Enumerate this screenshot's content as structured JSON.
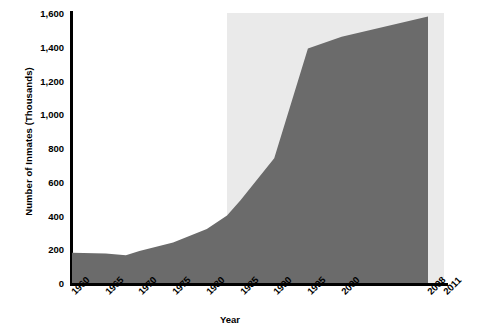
{
  "chart_data": {
    "type": "area",
    "title": "",
    "xlabel": "Year",
    "ylabel": "Number of Inmates (Thousands)",
    "xlim": [
      1960,
      2011
    ],
    "ylim": [
      0,
      1600
    ],
    "grid": false,
    "legend": "none",
    "x_tick_labels": [
      "1960",
      "1965",
      "1970",
      "1975",
      "1980",
      "1985",
      "1990",
      "1995",
      "2000",
      "2008",
      "2011"
    ],
    "x_tick_values": [
      1960,
      1965,
      1970,
      1975,
      1980,
      1985,
      1990,
      1995,
      2000,
      2008,
      2011
    ],
    "y_tick_labels": [
      "0",
      "200",
      "400",
      "600",
      "800",
      "1,000",
      "1,200",
      "1,400",
      "1,600"
    ],
    "y_tick_values": [
      0,
      200,
      400,
      600,
      800,
      1000,
      1200,
      1400,
      1600
    ],
    "series": [
      {
        "name": "Number of Inmates (Thousands)",
        "color": "#6b6b6b",
        "x": [
          1960,
          1965,
          1968,
          1970,
          1975,
          1980,
          1983,
          1985,
          1990,
          1995,
          2000,
          2008
        ],
        "values": [
          180,
          175,
          165,
          190,
          240,
          320,
          400,
          490,
          740,
          1390,
          1460,
          1580
        ]
      }
    ],
    "shaded_region": {
      "label": "highlight-band",
      "color": "#eaeaea",
      "x_start": 1983,
      "x_end": 2011
    }
  },
  "axis": {
    "y_title": "Number of Inmates (Thousands)",
    "x_title": "Year"
  }
}
